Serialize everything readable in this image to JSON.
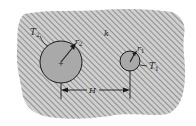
{
  "diagram": {
    "medium_label": "k",
    "cylinder_large": {
      "temperature_label": "T",
      "temperature_sub": "2",
      "radius_label": "r",
      "radius_sub": "2",
      "cx": 61,
      "cy": 62,
      "r": 21
    },
    "cylinder_small": {
      "temperature_label": "T",
      "temperature_sub": "1",
      "radius_label": "r",
      "radius_sub": "1",
      "cx": 130,
      "cy": 61,
      "r": 10
    },
    "separation_label": "H",
    "colors": {
      "background": "#ffffff",
      "medium_fill": "#c8c8c8",
      "hatch_line": "#8a8a8a",
      "cylinder_fill": "#a9a9a9",
      "stroke": "#1a1a1a"
    }
  }
}
